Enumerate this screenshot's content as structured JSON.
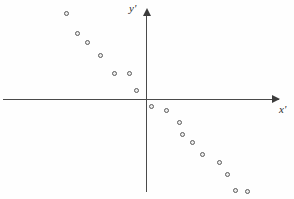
{
  "chart_data": {
    "type": "scatter",
    "title": "",
    "xlabel": "x'",
    "ylabel": "y'",
    "grid": false,
    "legend": null,
    "axes": {
      "origin_px": [
        147,
        100
      ],
      "x_axis_label": "x'",
      "y_axis_label": "y'",
      "x_arrow": true,
      "y_arrow": true,
      "xlim_px": [
        3,
        279
      ],
      "ylim_px": [
        13,
        192
      ],
      "tick_labels_x": [],
      "tick_labels_y": []
    },
    "series": [
      {
        "name": "points",
        "marker": "open-circle",
        "marker_color": "#5b5b5b",
        "points_px": [
          [
            67,
            14
          ],
          [
            78,
            34
          ],
          [
            88,
            43
          ],
          [
            101,
            56
          ],
          [
            115,
            74
          ],
          [
            130,
            74
          ],
          [
            137,
            91
          ],
          [
            152,
            107
          ],
          [
            167,
            111
          ],
          [
            180,
            123
          ],
          [
            183,
            135
          ],
          [
            193,
            143
          ],
          [
            203,
            155
          ],
          [
            220,
            163
          ],
          [
            228,
            175
          ],
          [
            236,
            191
          ],
          [
            248,
            192
          ]
        ],
        "x": [
          -80,
          -69,
          -59,
          -46,
          -32,
          -17,
          -10,
          5,
          20,
          33,
          36,
          46,
          56,
          73,
          81,
          89,
          101
        ],
        "y": [
          86,
          66,
          57,
          44,
          26,
          26,
          9,
          -7,
          -11,
          -23,
          -35,
          -43,
          -55,
          -63,
          -75,
          -91,
          -92
        ]
      }
    ]
  }
}
